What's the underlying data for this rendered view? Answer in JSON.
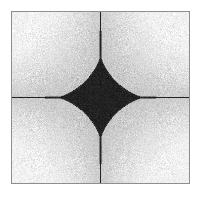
{
  "figure": {
    "title": "Astroid diffraction pattern",
    "width": 201,
    "height": 199
  },
  "frame": {
    "name": "plot-frame",
    "left": 11,
    "top": 11,
    "width": 179,
    "height": 173,
    "border_color": "#8e8e8e",
    "border_width": 1
  },
  "colors": {
    "page_background": "#ffffff",
    "field_light": "#f2f2f2",
    "field_mid": "#d0d0d0",
    "field_dark": "#b8b8b8",
    "shape_fill": "#1d1d1d",
    "shape_fill_alt": "#2e2e2e",
    "border": "#8e8e8e",
    "noise_light": "#ffffff",
    "noise_dark": "#9a9a9a"
  },
  "chart_data": {
    "type": "scatter",
    "title": "Astroid diffraction pattern",
    "subtitle": "",
    "xlabel": "",
    "ylabel": "",
    "xlim": [
      -1,
      1
    ],
    "ylim": [
      -1,
      1
    ],
    "grid": false,
    "legend": "none",
    "annotations": [],
    "shape": {
      "name": "astroid",
      "equation": "|x|^(2/3) + |y|^(2/3) = 1",
      "center_x": 0.0,
      "center_y": 0.0,
      "radius_x": 0.52,
      "radius_y": 0.52,
      "exponent": 0.666,
      "cusps": 4,
      "cusp_directions": [
        "up",
        "right",
        "down",
        "left"
      ],
      "fill_color": "#1d1d1d"
    },
    "spikes": [
      {
        "direction": "up",
        "axis": "vertical",
        "center": 0.0,
        "extent_to_edge": true,
        "width": 0.012
      },
      {
        "direction": "down",
        "axis": "vertical",
        "center": 0.0,
        "extent_to_edge": true,
        "width": 0.012
      },
      {
        "direction": "left",
        "axis": "horizontal",
        "center": 0.0,
        "extent_to_edge": true,
        "width": 0.01
      },
      {
        "direction": "right",
        "axis": "horizontal",
        "center": 0.0,
        "extent_to_edge": true,
        "width": 0.01
      }
    ],
    "background_field": {
      "kind": "radial-corner-gradient-with-noise",
      "brightest_at": "corners",
      "darkest_at": "edge-midpoints",
      "noise_amplitude": 30,
      "noise_density": 0.55
    },
    "center_axes": {
      "vertical_x_px": 101,
      "horizontal_y_px": 100
    }
  }
}
